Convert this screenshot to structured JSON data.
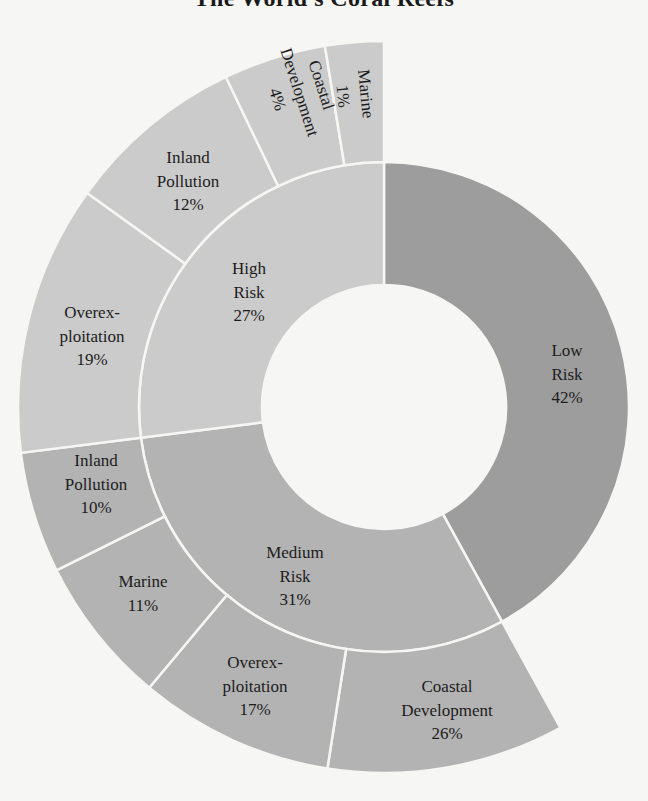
{
  "title": "The World's Coral Reefs",
  "chart_data": {
    "type": "sunburst",
    "title": "The World's Coral Reefs",
    "center": [
      384,
      407
    ],
    "radii": [
      122,
      245,
      366
    ],
    "colors": {
      "background": "#f6f6f4",
      "low": "#9d9d9d",
      "medium": "#b3b3b3",
      "high": "#cbcbcb",
      "text": "#1c1c1c",
      "divider": "#f6f6f4"
    },
    "inner_ring": [
      {
        "name": "Low Risk",
        "lines": [
          "Low",
          "Risk",
          "42%"
        ],
        "value": 42,
        "start": 0,
        "end": 151.2,
        "color": "low",
        "label_pos": [
          567,
          350
        ]
      },
      {
        "name": "Medium Risk",
        "lines": [
          "Medium",
          "Risk",
          "31%"
        ],
        "value": 31,
        "start": 151.2,
        "end": 262.8,
        "color": "medium",
        "label_pos": [
          295,
          552
        ]
      },
      {
        "name": "High Risk",
        "lines": [
          "High",
          "Risk",
          "27%"
        ],
        "value": 27,
        "start": 262.8,
        "end": 360,
        "color": "high",
        "label_pos": [
          249,
          268
        ]
      }
    ],
    "outer_ring": [
      {
        "parent": "Medium Risk",
        "name": "Coastal Development",
        "lines": [
          "Coastal",
          "Development",
          "26%"
        ],
        "value": 26,
        "start": 151.2,
        "end": 188.9,
        "color": "medium",
        "label_pos": [
          447,
          686
        ],
        "rotate": 0
      },
      {
        "parent": "Medium Risk",
        "name": "Overexploitation",
        "lines": [
          "Overex-",
          "ploitation",
          "17%"
        ],
        "value": 17,
        "start": 188.9,
        "end": 219.9,
        "color": "medium",
        "label_pos": [
          255,
          662
        ],
        "rotate": 0
      },
      {
        "parent": "Medium Risk",
        "name": "Marine",
        "lines": [
          "Marine",
          "11%"
        ],
        "value": 11,
        "start": 219.9,
        "end": 243.5,
        "color": "medium",
        "label_pos": [
          143,
          581
        ],
        "rotate": 0
      },
      {
        "parent": "Medium Risk",
        "name": "Inland Pollution",
        "lines": [
          "Inland",
          "Pollution",
          "10%"
        ],
        "value": 10,
        "start": 243.5,
        "end": 262.8,
        "color": "medium",
        "label_pos": [
          96,
          460
        ],
        "rotate": 0
      },
      {
        "parent": "High Risk",
        "name": "Overexploitation",
        "lines": [
          "Overex-",
          "ploitation",
          "19%"
        ],
        "value": 19,
        "start": 262.8,
        "end": 305.8,
        "color": "high",
        "label_pos": [
          92,
          312
        ],
        "rotate": 0
      },
      {
        "parent": "High Risk",
        "name": "Inland Pollution",
        "lines": [
          "Inland",
          "Pollution",
          "12%"
        ],
        "value": 12,
        "start": 305.8,
        "end": 334.4,
        "color": "high",
        "label_pos": [
          188,
          157
        ],
        "rotate": 0
      },
      {
        "parent": "High Risk",
        "name": "Coastal Development",
        "lines": [
          "Coastal",
          "Development",
          "4%"
        ],
        "value": 4,
        "start": 334.4,
        "end": 350.7,
        "color": "high",
        "label_pos": [
          300,
          92
        ],
        "rotate": 72
      },
      {
        "parent": "High Risk",
        "name": "Marine",
        "lines": [
          "Marine",
          "1%"
        ],
        "value": 1,
        "start": 350.7,
        "end": 360,
        "color": "high",
        "label_pos": [
          355,
          95
        ],
        "rotate": 84
      }
    ],
    "legend": null
  }
}
